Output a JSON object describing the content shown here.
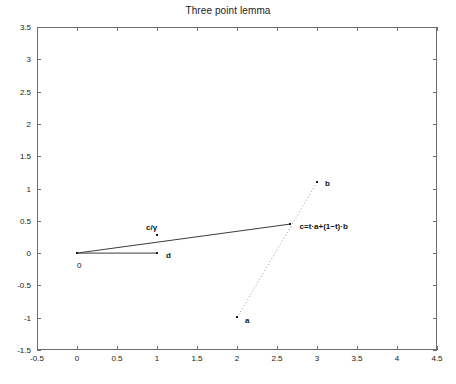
{
  "chart_data": {
    "type": "scatter",
    "title": "Three point lemma",
    "xlabel": "",
    "ylabel": "",
    "xlim": [
      -0.5,
      4.5
    ],
    "ylim": [
      -1.5,
      3.5
    ],
    "grid": false,
    "legend": "none",
    "xticks": [
      "-0.5",
      "0",
      "0.5",
      "1",
      "1.5",
      "2",
      "2.5",
      "3",
      "3.5",
      "4",
      "4.5"
    ],
    "xtick_values": [
      -0.5,
      0,
      0.5,
      1,
      1.5,
      2,
      2.5,
      3,
      3.5,
      4,
      4.5
    ],
    "yticks": [
      "-1.5",
      "-1",
      "-0.5",
      "0",
      "0.5",
      "1",
      "1.5",
      "2",
      "2.5",
      "3",
      "3.5"
    ],
    "ytick_values": [
      -1.5,
      -1,
      -0.5,
      0,
      0.5,
      1,
      1.5,
      2,
      2.5,
      3,
      3.5
    ],
    "points": [
      {
        "name": "origin",
        "label": "0",
        "x": 0,
        "y": 0,
        "label_dx": 0,
        "label_dy": 14,
        "bold": false
      },
      {
        "name": "d",
        "label": "d",
        "x": 1,
        "y": 0,
        "label_dx": 9,
        "label_dy": 4,
        "bold": true
      },
      {
        "name": "a",
        "label": "a",
        "x": 2,
        "y": -1,
        "label_dx": 8,
        "label_dy": 4,
        "bold": true
      },
      {
        "name": "b",
        "label": "b",
        "x": 3,
        "y": 1.1,
        "label_dx": 8,
        "label_dy": 3,
        "bold": true
      },
      {
        "name": "c",
        "label": "c=t·a+(1−t)·b",
        "x": 2.67,
        "y": 0.45,
        "label_dx": 9,
        "label_dy": 4,
        "bold": true
      },
      {
        "name": "c-over-gamma",
        "label": "c/γ",
        "x": 1.0,
        "y": 0.28,
        "label_dx": -11,
        "label_dy": -6,
        "bold": true
      }
    ],
    "segments": [
      {
        "name": "origin-to-d",
        "x1": 0,
        "y1": 0,
        "x2": 1,
        "y2": 0,
        "style": "solid",
        "color": "#3c3c3c",
        "width": 1
      },
      {
        "name": "origin-to-c",
        "x1": 0,
        "y1": 0,
        "x2": 2.67,
        "y2": 0.45,
        "style": "solid",
        "color": "#3c3c3c",
        "width": 1
      },
      {
        "name": "a-to-b",
        "x1": 2,
        "y1": -1,
        "x2": 3,
        "y2": 1.1,
        "style": "dotted",
        "color": "#9a9a9a",
        "width": 1
      }
    ],
    "colors": {
      "axis": "#6e6e6e",
      "text": "#1a1a1a",
      "segment": "#3c3c3c",
      "dotted": "#9a9a9a",
      "background": "#ffffff"
    }
  }
}
